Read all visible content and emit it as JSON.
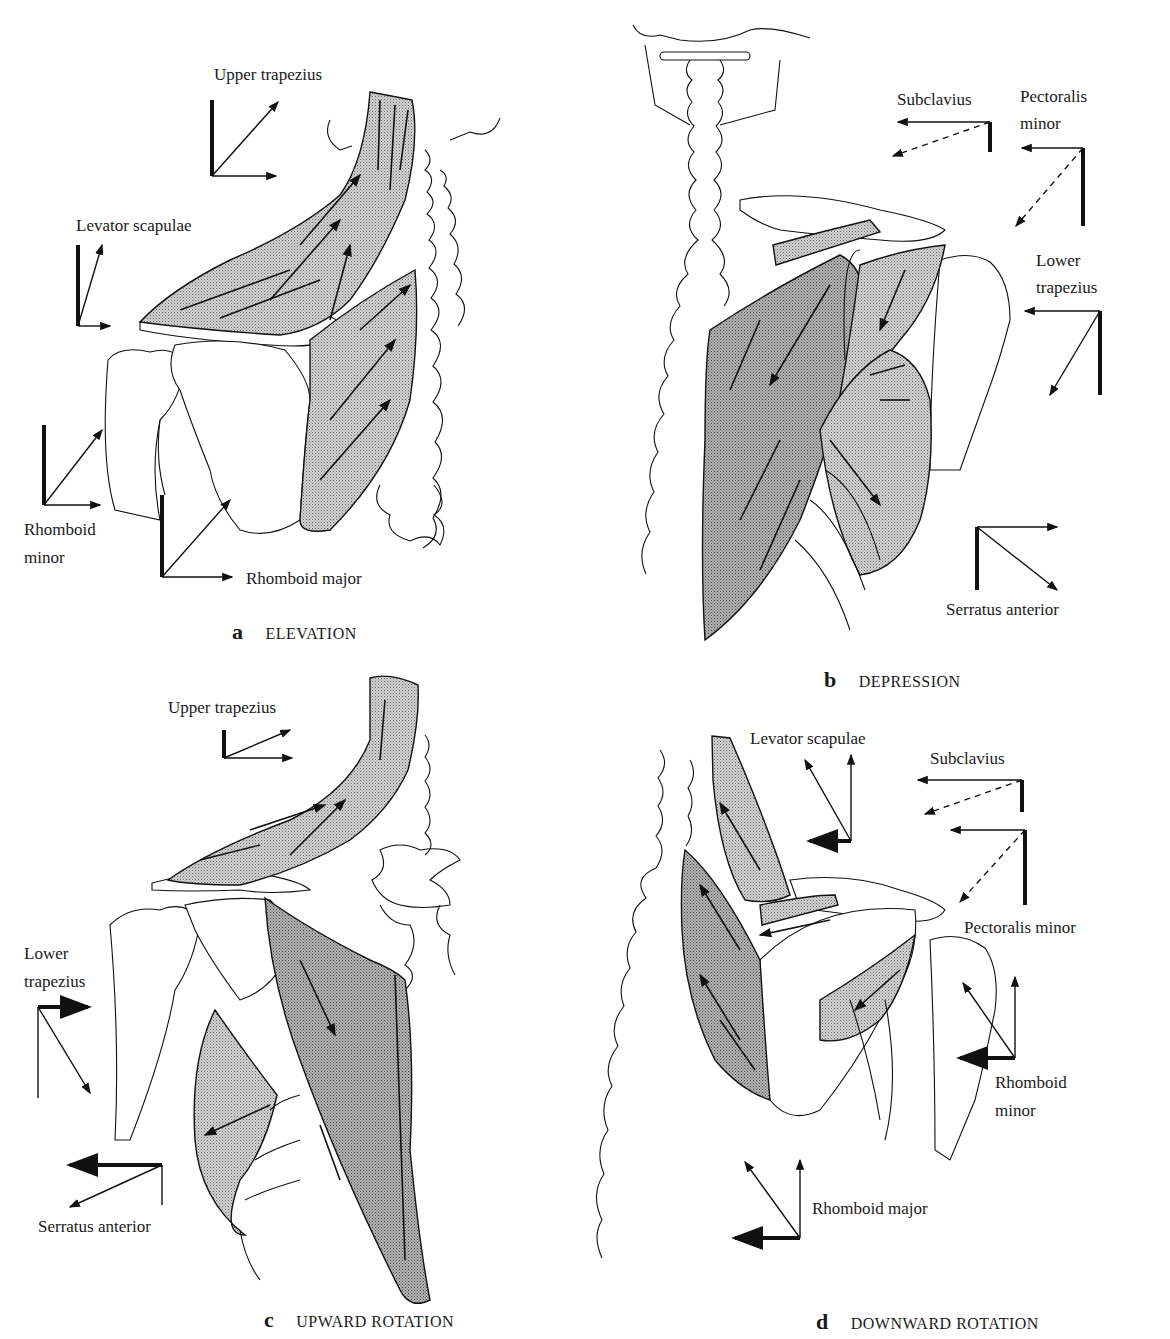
{
  "figure": {
    "panels": [
      {
        "id": "a",
        "letter": "a",
        "title": "ELEVATION",
        "labels": {
          "upper_trapezius": "Upper trapezius",
          "levator_scapulae": "Levator scapulae",
          "rhomboid_minor_line1": "Rhomboid",
          "rhomboid_minor_line2": "minor",
          "rhomboid_major": "Rhomboid major"
        }
      },
      {
        "id": "b",
        "letter": "b",
        "title": "DEPRESSION",
        "labels": {
          "subclavius": "Subclavius",
          "pectoralis_minor_line1": "Pectoralis",
          "pectoralis_minor_line2": "minor",
          "lower_trapezius_line1": "Lower",
          "lower_trapezius_line2": "trapezius",
          "serratus_anterior": "Serratus anterior"
        }
      },
      {
        "id": "c",
        "letter": "c",
        "title": "UPWARD ROTATION",
        "labels": {
          "upper_trapezius": "Upper trapezius",
          "lower_trapezius_line1": "Lower",
          "lower_trapezius_line2": "trapezius",
          "serratus_anterior": "Serratus anterior"
        }
      },
      {
        "id": "d",
        "letter": "d",
        "title": "DOWNWARD ROTATION",
        "labels": {
          "levator_scapulae": "Levator scapulae",
          "subclavius": "Subclavius",
          "pectoralis_minor": "Pectoralis minor",
          "rhomboid_minor_line1": "Rhomboid",
          "rhomboid_minor_line2": "minor",
          "rhomboid_major": "Rhomboid major"
        }
      }
    ]
  },
  "colors": {
    "ink": "#111111",
    "muscle_fill": "#c8c8c8",
    "muscle_fill_dark": "#a9a9a9",
    "background": "#ffffff"
  }
}
